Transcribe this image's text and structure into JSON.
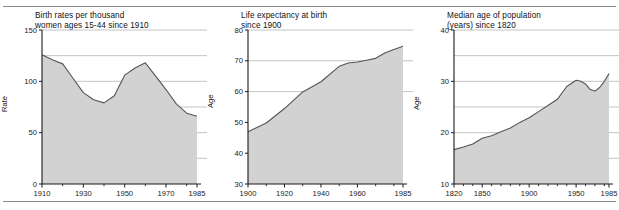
{
  "figure": {
    "background_color": "#ffffff",
    "area_fill_color": "#d2d2d2",
    "line_color": "#555555",
    "grid_color": "#b5b5b5",
    "axis_color": "#1a1a1a"
  },
  "chart_data": [
    {
      "type": "area",
      "title": "Birth rates per thousand\nwomen ages 15-44 since 1910",
      "xlabel": "",
      "ylabel": "Rate",
      "xlim": [
        1910,
        1985
      ],
      "ylim": [
        0,
        150
      ],
      "grid": true,
      "gridlines": [
        25,
        50,
        75,
        100,
        125,
        150
      ],
      "legend": "none",
      "xticks": [
        1910,
        1930,
        1950,
        1970,
        1985
      ],
      "xtick_labels": [
        "1910",
        "1930",
        "1950",
        "1970",
        "1985"
      ],
      "xminorticks": [
        1920,
        1940,
        1960,
        1980
      ],
      "yticks": [
        0,
        50,
        100,
        150
      ],
      "ytick_labels": [
        "0",
        "50",
        "100",
        "150"
      ],
      "x": [
        1910,
        1915,
        1920,
        1925,
        1930,
        1935,
        1940,
        1945,
        1950,
        1955,
        1960,
        1965,
        1970,
        1975,
        1980,
        1985
      ],
      "values": [
        126,
        121,
        117,
        103,
        89,
        82,
        79,
        86,
        106,
        113,
        118,
        105,
        92,
        78,
        69,
        66
      ]
    },
    {
      "type": "area",
      "title": "Life expectancy at birth\nsince 1900",
      "xlabel": "",
      "ylabel": "Age",
      "xlim": [
        1900,
        1985
      ],
      "ylim": [
        30,
        80
      ],
      "grid": true,
      "gridlines": [
        60,
        70,
        80
      ],
      "legend": "none",
      "xticks": [
        1900,
        1920,
        1940,
        1960,
        1985
      ],
      "xtick_labels": [
        "1900",
        "1920",
        "1940",
        "1960",
        "1985"
      ],
      "xminorticks": [
        1910,
        1930,
        1950,
        1970,
        1980
      ],
      "yticks": [
        30,
        40,
        50,
        60,
        70,
        80
      ],
      "ytick_labels": [
        "30",
        "40",
        "50",
        "60",
        "70",
        "80"
      ],
      "x": [
        1900,
        1910,
        1920,
        1930,
        1940,
        1950,
        1955,
        1960,
        1965,
        1970,
        1975,
        1980,
        1985
      ],
      "values": [
        47.0,
        49.8,
        54.5,
        59.9,
        63.2,
        68.2,
        69.3,
        69.6,
        70.2,
        70.8,
        72.5,
        73.7,
        74.7
      ]
    },
    {
      "type": "area",
      "title": "Median age of population\n(years) since 1820",
      "xlabel": "",
      "ylabel": "Age",
      "xlim": [
        1820,
        1985
      ],
      "ylim": [
        10,
        40
      ],
      "grid": true,
      "gridlines": [
        15,
        20,
        25,
        30,
        35,
        40
      ],
      "legend": "none",
      "xticks": [
        1820,
        1850,
        1900,
        1950,
        1985
      ],
      "xtick_labels": [
        "1820",
        "1850",
        "1900",
        "1950",
        "1985"
      ],
      "xminorticks": [
        1830,
        1840,
        1860,
        1870,
        1880,
        1890,
        1910,
        1920,
        1930,
        1940,
        1960,
        1970,
        1980
      ],
      "yticks": [
        10,
        20,
        30,
        40
      ],
      "ytick_labels": [
        "10",
        "20",
        "30",
        "40"
      ],
      "x": [
        1820,
        1830,
        1840,
        1850,
        1860,
        1870,
        1880,
        1890,
        1900,
        1910,
        1920,
        1930,
        1940,
        1950,
        1955,
        1960,
        1965,
        1970,
        1975,
        1980,
        1985
      ],
      "values": [
        16.7,
        17.2,
        17.8,
        18.9,
        19.4,
        20.2,
        20.9,
        22.0,
        22.9,
        24.1,
        25.3,
        26.5,
        29.0,
        30.2,
        30.0,
        29.5,
        28.4,
        28.1,
        28.8,
        30.0,
        31.5
      ]
    }
  ]
}
